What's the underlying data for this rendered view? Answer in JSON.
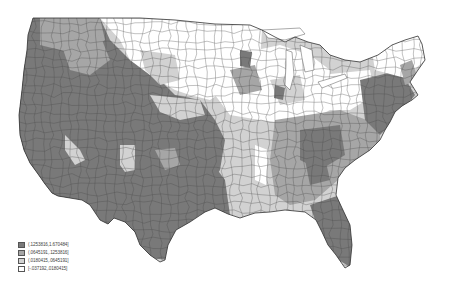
{
  "map": {
    "type": "choropleth",
    "region": "Contiguous United States",
    "unit": "commuting-zone / county groupings",
    "palette": {
      "class4": "#7a7a7a",
      "class3": "#a6a6a6",
      "class2": "#d2d2d2",
      "class1": "#ffffff",
      "border": "#3a3a3a"
    }
  },
  "legend": {
    "items": [
      {
        "label": "(.1253816,1.670484]",
        "color": "#7a7a7a"
      },
      {
        "label": "(.0645191,.1253816]",
        "color": "#a6a6a6"
      },
      {
        "label": "(.0180415,.0645191]",
        "color": "#d2d2d2"
      },
      {
        "label": "[-.037192,.0180415]",
        "color": "#ffffff"
      }
    ]
  },
  "chart_data": {
    "type": "heatmap",
    "title": "",
    "classes": [
      {
        "range": "(.1253816,1.670484]",
        "shade": "darkest"
      },
      {
        "range": "(.0645191,.1253816]",
        "shade": "dark"
      },
      {
        "range": "(.0180415,.0645191]",
        "shade": "light"
      },
      {
        "range": "[-.037192,.0180415]",
        "shade": "white"
      }
    ],
    "regional_pattern": {
      "West / Southwest": "mostly darkest class",
      "California coast": "darkest class",
      "Texas": "darkest class",
      "Florida": "darkest class",
      "Northeast corridor": "darkest to dark",
      "Northern Plains": "mostly white",
      "Midwest": "mixed light and white",
      "Southeast": "mixed dark and darkest"
    },
    "legend_position": "bottom-left"
  }
}
